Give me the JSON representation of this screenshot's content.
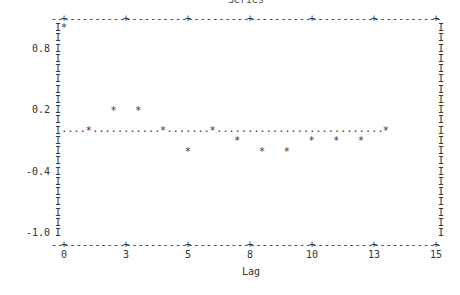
{
  "chart": {
    "title": "Series",
    "xlabel": "Lag",
    "ylabel": ""
  },
  "chart_data": {
    "type": "scatter",
    "title": "Series",
    "xlabel": "Lag",
    "ylabel": "",
    "x": [
      0,
      1,
      2,
      3,
      4,
      5,
      6,
      7,
      8,
      9,
      10,
      11,
      12,
      13
    ],
    "values": [
      1.0,
      0.0,
      0.2,
      0.2,
      0.0,
      -0.2,
      0.0,
      -0.1,
      -0.2,
      -0.2,
      -0.1,
      -0.1,
      -0.1,
      0.0
    ],
    "xlim": [
      0,
      15
    ],
    "ylim": [
      -1.1,
      1.1
    ],
    "x_tick_labels": [
      "0",
      "3",
      "5",
      "8",
      "10",
      "13",
      "15"
    ],
    "y_tick_labels": [
      "0.8",
      "0.2",
      "-0.4",
      "-1.0"
    ],
    "reference_line": {
      "y": 0.0,
      "style": "dotted",
      "x_range": [
        0,
        13
      ]
    },
    "marker": "*",
    "grid": false,
    "legend": null
  },
  "layout": {
    "left_x": 58,
    "right_x": 438,
    "top_y": 19,
    "bottom_y": 245,
    "x0_px": 64,
    "px_per_lag": 24.75,
    "y_zero_px": 131,
    "px_per_tenth": 10.25,
    "x_tick_px": [
      64,
      126,
      188,
      250,
      312,
      374,
      436
    ],
    "y_tick_px": {
      "0.8": 49,
      "0.2": 110,
      "-0.4": 172,
      "-1.0": 233
    }
  }
}
